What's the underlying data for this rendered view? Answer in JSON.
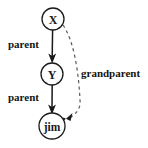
{
  "diagram": {
    "background_color": "#ffffff",
    "node_stroke_color": "#1a1a1a",
    "solid_edge_color": "#1a1a1a",
    "dashed_edge_color": "#5a5a5a",
    "text_color": "#141414",
    "nodes": [
      {
        "id": "x",
        "label": "X",
        "cx": 53,
        "cy": 19,
        "r": 11
      },
      {
        "id": "y",
        "label": "Y",
        "cx": 52,
        "cy": 74,
        "r": 11
      },
      {
        "id": "jim",
        "label": "jim",
        "cx": 52,
        "cy": 126,
        "r": 13
      }
    ],
    "edges": [
      {
        "id": "x-to-y",
        "from": "x",
        "to": "y",
        "label": "parent",
        "style": "solid",
        "label_x": 8,
        "label_y": 44
      },
      {
        "id": "y-to-jim",
        "from": "y",
        "to": "jim",
        "label": "parent",
        "style": "solid",
        "label_x": 8,
        "label_y": 97
      },
      {
        "id": "x-to-jim",
        "from": "x",
        "to": "jim",
        "label": "grandparent",
        "style": "dashed",
        "label_x": 81,
        "label_y": 73
      }
    ]
  }
}
